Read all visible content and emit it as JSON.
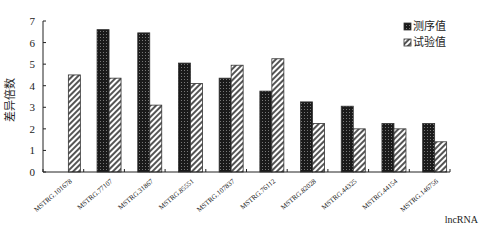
{
  "chart_data": {
    "type": "bar",
    "title": "",
    "xlabel": "lncRNA",
    "ylabel": "差异倍数",
    "ylim": [
      0,
      7
    ],
    "yticks": [
      0,
      1,
      2,
      3,
      4,
      5,
      6,
      7
    ],
    "grid": false,
    "legend_position": "top-right",
    "categories": [
      "MSTRG.101678",
      "MSTRG.77107",
      "MSTRG.31867",
      "MSTRG.85551",
      "MSTRG.107837",
      "MSTRG.76112",
      "MSTRG.82028",
      "MSTRG.44325",
      "MSTRG.44154",
      "MSTRG.146756"
    ],
    "series": [
      {
        "name": "测序值",
        "pattern": "dark-dotted",
        "values": [
          0,
          6.6,
          6.45,
          5.05,
          4.35,
          3.75,
          3.25,
          3.05,
          2.25,
          2.25
        ]
      },
      {
        "name": "试验值",
        "pattern": "diagonal-hatch",
        "values": [
          4.5,
          4.35,
          3.1,
          4.1,
          4.95,
          5.25,
          2.25,
          2.0,
          2.0,
          1.4
        ]
      }
    ]
  }
}
